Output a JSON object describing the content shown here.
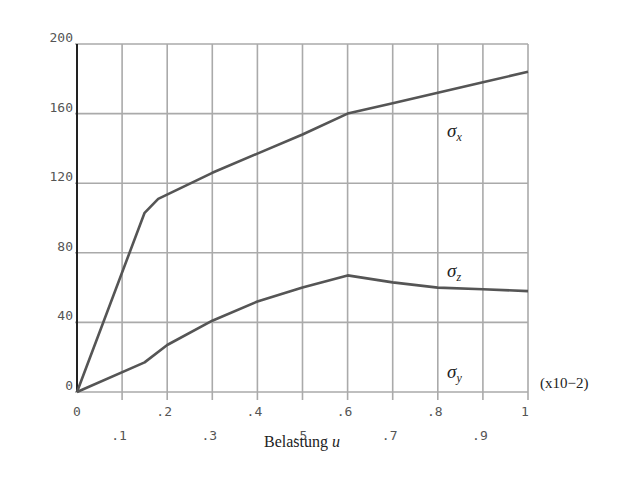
{
  "chart_data": {
    "type": "line",
    "title": "",
    "xlabel": "Belastung u",
    "xlabel_main": "Belastung ",
    "xlabel_var": "u",
    "ylabel": "",
    "x_scale_note": "(x10−2)",
    "xlim": [
      0,
      1
    ],
    "ylim": [
      0,
      200
    ],
    "grid": true,
    "legend_position": "inline labels at right",
    "x_tick_labels": [
      "0",
      ".1",
      ".2",
      ".3",
      ".4",
      ".5",
      ".6",
      ".7",
      ".8",
      ".9",
      "1"
    ],
    "y_tick_labels": [
      "0",
      "40",
      "80",
      "120",
      "160",
      "200"
    ],
    "x": [
      0,
      0.15,
      0.18,
      0.3,
      0.4,
      0.5,
      0.6,
      0.7,
      0.8,
      0.9,
      1.0
    ],
    "series": [
      {
        "name": "σx",
        "symbol": "σ",
        "subscript": "x",
        "x": [
          0,
          0.15,
          0.18,
          0.3,
          0.4,
          0.5,
          0.6,
          0.7,
          0.8,
          0.9,
          1.0
        ],
        "values": [
          0,
          103,
          111,
          126,
          137,
          148,
          160,
          166,
          172,
          178,
          184
        ]
      },
      {
        "name": "σz",
        "symbol": "σ",
        "subscript": "z",
        "x": [
          0,
          0.15,
          0.2,
          0.3,
          0.4,
          0.5,
          0.6,
          0.7,
          0.8,
          0.9,
          1.0
        ],
        "values": [
          0,
          17,
          27,
          41,
          52,
          60,
          67,
          63,
          60,
          59,
          58
        ]
      },
      {
        "name": "σy",
        "symbol": "σ",
        "subscript": "y",
        "x": [
          0,
          1.0
        ],
        "values": [
          0,
          0
        ]
      }
    ]
  }
}
